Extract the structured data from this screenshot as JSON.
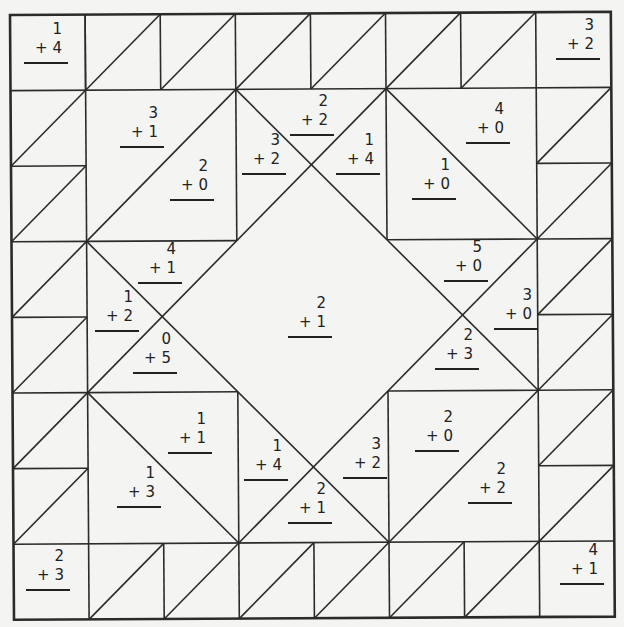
{
  "worksheet": {
    "type": "addition color-by-sum quilt puzzle",
    "problems": [
      {
        "id": "corner-top-left",
        "addend1": "1",
        "addend2": "+ 4",
        "x": 46,
        "y": 20
      },
      {
        "id": "corner-top-right",
        "addend1": "3",
        "addend2": "+ 2",
        "x": 578,
        "y": 16
      },
      {
        "id": "tl-block-upper",
        "addend1": "3",
        "addend2": "+ 1",
        "x": 142,
        "y": 104
      },
      {
        "id": "tl-block-lower",
        "addend1": "2",
        "addend2": "+ 0",
        "x": 192,
        "y": 157
      },
      {
        "id": "top-x-left",
        "addend1": "3",
        "addend2": "+ 2",
        "x": 264,
        "y": 131
      },
      {
        "id": "top-x-top",
        "addend1": "2",
        "addend2": "+ 2",
        "x": 312,
        "y": 92
      },
      {
        "id": "top-x-right",
        "addend1": "1",
        "addend2": "+ 4",
        "x": 358,
        "y": 131
      },
      {
        "id": "tr-block-upper",
        "addend1": "4",
        "addend2": "+ 0",
        "x": 488,
        "y": 100
      },
      {
        "id": "tr-block-lower",
        "addend1": "1",
        "addend2": "+ 0",
        "x": 434,
        "y": 156
      },
      {
        "id": "left-x-top",
        "addend1": "4",
        "addend2": "+ 1",
        "x": 160,
        "y": 240
      },
      {
        "id": "left-x-left",
        "addend1": "1",
        "addend2": "+ 2",
        "x": 117,
        "y": 288
      },
      {
        "id": "left-x-bottom",
        "addend1": "0",
        "addend2": "+ 5",
        "x": 155,
        "y": 330
      },
      {
        "id": "center-diamond",
        "addend1": "2",
        "addend2": "+ 1",
        "x": 310,
        "y": 294
      },
      {
        "id": "right-x-top",
        "addend1": "5",
        "addend2": "+ 0",
        "x": 466,
        "y": 238
      },
      {
        "id": "right-x-right",
        "addend1": "3",
        "addend2": "+ 0",
        "x": 516,
        "y": 286
      },
      {
        "id": "right-x-bottom",
        "addend1": "2",
        "addend2": "+ 3",
        "x": 457,
        "y": 326
      },
      {
        "id": "bl-block-upper",
        "addend1": "1",
        "addend2": "+ 1",
        "x": 190,
        "y": 410
      },
      {
        "id": "bl-block-lower",
        "addend1": "1",
        "addend2": "+ 3",
        "x": 139,
        "y": 464
      },
      {
        "id": "bottom-x-left",
        "addend1": "1",
        "addend2": "+ 4",
        "x": 266,
        "y": 437
      },
      {
        "id": "bottom-x-bottom",
        "addend1": "2",
        "addend2": "+ 1",
        "x": 310,
        "y": 480
      },
      {
        "id": "bottom-x-right",
        "addend1": "3",
        "addend2": "+ 2",
        "x": 365,
        "y": 435
      },
      {
        "id": "br-block-upper",
        "addend1": "2",
        "addend2": "+ 0",
        "x": 437,
        "y": 408
      },
      {
        "id": "br-block-lower",
        "addend1": "2",
        "addend2": "+ 2",
        "x": 490,
        "y": 460
      },
      {
        "id": "corner-bottom-left",
        "addend1": "2",
        "addend2": "+ 3",
        "x": 48,
        "y": 547
      },
      {
        "id": "corner-bottom-right",
        "addend1": "4",
        "addend2": "+ 1",
        "x": 582,
        "y": 541
      }
    ]
  },
  "colors": {
    "line": "#2b2b2b",
    "paper": "#f4f4f2",
    "text": "#222222"
  }
}
